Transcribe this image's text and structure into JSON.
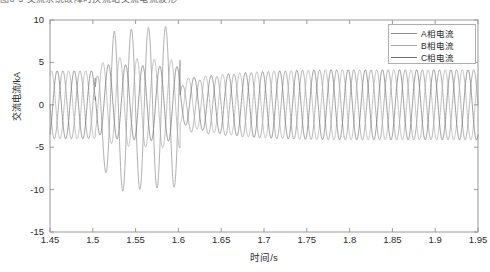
{
  "page": {
    "cut_text_above": "图3-5 交流系统故障时换流站交流电流波形"
  },
  "chart_data": {
    "type": "line",
    "title": "",
    "xlabel": "时间/s",
    "ylabel": "交流电流/kA",
    "xlim": [
      1.45,
      1.95
    ],
    "ylim": [
      -15,
      10
    ],
    "xticks": [
      1.45,
      1.5,
      1.55,
      1.6,
      1.65,
      1.7,
      1.75,
      1.8,
      1.85,
      1.9,
      1.95
    ],
    "xtick_labels": [
      "1.45",
      "1.5",
      "1.55",
      "1.6",
      "1.65",
      "1.7",
      "1.75",
      "1.8",
      "1.85",
      "1.9",
      "1.95"
    ],
    "yticks": [
      10,
      5,
      0,
      -5,
      -10,
      -15
    ],
    "ytick_labels": [
      "10",
      "5",
      "0",
      "-5",
      "-10",
      "-15"
    ],
    "grid": false,
    "legend_position": "upper right",
    "frequency_hz": 50,
    "series": [
      {
        "name": "A相电流",
        "color": "#8c8c8c",
        "phase_deg": 0,
        "prefault_amplitude": 4.0,
        "fault_amplitude": 9.5,
        "fault_dc_offset": -1.2,
        "postfault_amplitude": 2.6,
        "recovery_amplitude": 4.2
      },
      {
        "name": "B相电流",
        "color": "#a8a8a8",
        "phase_deg": -120,
        "prefault_amplitude": 4.0,
        "fault_amplitude": 5.2,
        "fault_dc_offset": 0.6,
        "postfault_amplitude": 2.6,
        "recovery_amplitude": 4.2
      },
      {
        "name": "C相电流",
        "color": "#6f6f6f",
        "phase_deg": 120,
        "prefault_amplitude": 4.0,
        "fault_amplitude": 4.4,
        "fault_dc_offset": 0.6,
        "postfault_amplitude": 2.6,
        "recovery_amplitude": 4.2
      }
    ],
    "events": {
      "fault_start_s": 1.503,
      "fault_clear_s": 1.602,
      "recovery_end_s": 1.78
    },
    "annotations": {
      "peak_positive_ka": 9.6,
      "peak_negative_ka": -11.6
    }
  }
}
